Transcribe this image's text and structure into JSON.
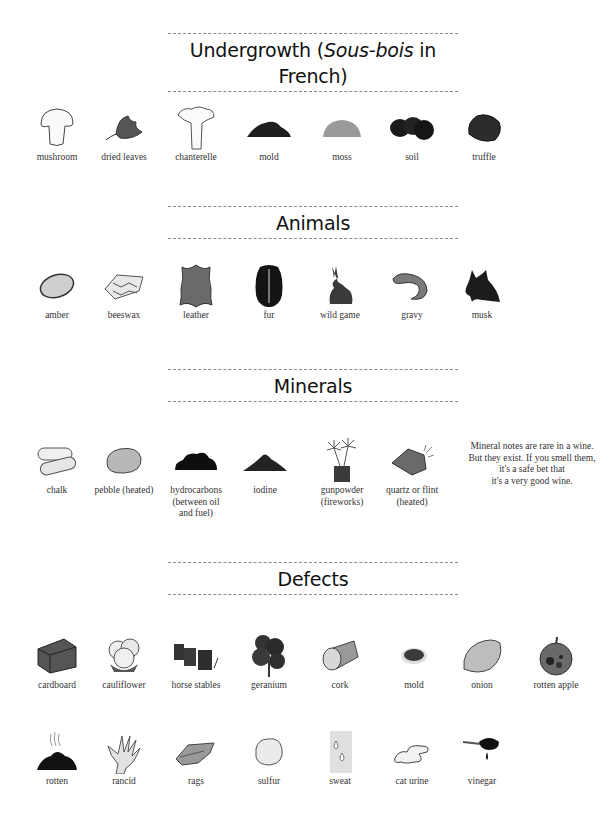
{
  "sections": {
    "undergrowth": {
      "title_prefix": "Undergrowth (",
      "title_italic": "Sous-bois",
      "title_suffix": " in French)",
      "items": [
        {
          "label": "mushroom",
          "icon": "mushroom-icon"
        },
        {
          "label": "dried leaves",
          "icon": "dried-leaves-icon"
        },
        {
          "label": "chanterelle",
          "icon": "chanterelle-icon"
        },
        {
          "label": "mold",
          "icon": "mold-pile-icon"
        },
        {
          "label": "moss",
          "icon": "moss-icon"
        },
        {
          "label": "soil",
          "icon": "soil-icon"
        },
        {
          "label": "truffle",
          "icon": "truffle-icon"
        }
      ]
    },
    "animals": {
      "title": "Animals",
      "items": [
        {
          "label": "amber",
          "icon": "amber-icon"
        },
        {
          "label": "beeswax",
          "icon": "beeswax-icon"
        },
        {
          "label": "leather",
          "icon": "leather-icon"
        },
        {
          "label": "fur",
          "icon": "fur-icon"
        },
        {
          "label": "wild game",
          "icon": "rabbit-icon"
        },
        {
          "label": "gravy",
          "icon": "gravy-icon"
        },
        {
          "label": "musk",
          "icon": "musk-animal-icon"
        }
      ]
    },
    "minerals": {
      "title": "Minerals",
      "items": [
        {
          "label": "chalk",
          "icon": "chalk-icon"
        },
        {
          "label": "pebble (heated)",
          "icon": "pebble-icon"
        },
        {
          "label": "hydrocarbons (between oil and fuel)",
          "label_lines": [
            "hydrocarbons",
            "(between oil",
            "and fuel)"
          ],
          "icon": "hydrocarbons-icon"
        },
        {
          "label": "iodine",
          "icon": "iodine-icon"
        },
        {
          "label": "gunpowder (fireworks)",
          "label_lines": [
            "gunpowder",
            "(fireworks)"
          ],
          "icon": "fireworks-icon"
        },
        {
          "label": "quartz or flint (heated)",
          "label_lines": [
            "quartz or flint",
            "(heated)"
          ],
          "icon": "flint-icon"
        }
      ],
      "note_lines": [
        "Mineral notes are rare in a wine.",
        "But they exist. If you smell them,",
        "it's a safe bet that",
        "it's a very good wine."
      ]
    },
    "defects": {
      "title": "Defects",
      "items": [
        {
          "label": "cardboard",
          "icon": "cardboard-box-icon"
        },
        {
          "label": "cauliflower",
          "icon": "cauliflower-icon"
        },
        {
          "label": "horse stables",
          "icon": "horse-stables-icon"
        },
        {
          "label": "geranium",
          "icon": "geranium-icon"
        },
        {
          "label": "cork",
          "icon": "cork-icon"
        },
        {
          "label": "mold",
          "icon": "mold-spot-icon"
        },
        {
          "label": "onion",
          "icon": "onion-icon"
        },
        {
          "label": "rotten apple",
          "icon": "rotten-apple-icon"
        },
        {
          "label": "rotten",
          "icon": "rotten-pile-icon"
        },
        {
          "label": "rancid",
          "icon": "rancid-hand-icon"
        },
        {
          "label": "rags",
          "icon": "rags-icon"
        },
        {
          "label": "sulfur",
          "icon": "sulfur-icon"
        },
        {
          "label": "sweat",
          "icon": "sweat-drops-icon"
        },
        {
          "label": "cat urine",
          "icon": "cat-urine-icon"
        },
        {
          "label": "vinegar",
          "icon": "vinegar-spoon-icon"
        }
      ]
    }
  }
}
